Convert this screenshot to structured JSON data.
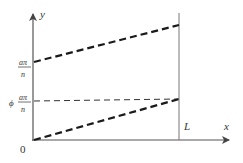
{
  "diagram": {
    "type": "line-graph-sketch",
    "axes": {
      "x_label": "x",
      "y_label": "y",
      "origin_label": "0",
      "x_marker_label": "L"
    },
    "y_ticks": [
      {
        "id": "upper",
        "numerator": "aπ",
        "denominator": "n",
        "prefix": ""
      },
      {
        "id": "lower",
        "numerator": "aπ",
        "denominator": "n",
        "prefix": "ϕ"
      }
    ],
    "lines": [
      {
        "id": "upper-thick-dashed",
        "from": "(0, aπ/n)",
        "to": "(L, above)",
        "style": "thick-dashed"
      },
      {
        "id": "phi-thin-dashed",
        "from": "(0, ϕ aπ/n)",
        "to": "(L, ϕ aπ/n)",
        "style": "thin-dashed"
      },
      {
        "id": "lower-thick-dashed",
        "from": "(0, 0)",
        "to": "(L, ϕ aπ/n)",
        "style": "thick-dashed"
      }
    ],
    "colors": {
      "axis": "#555555",
      "line": "#1a1a1a",
      "text": "#333333"
    }
  }
}
